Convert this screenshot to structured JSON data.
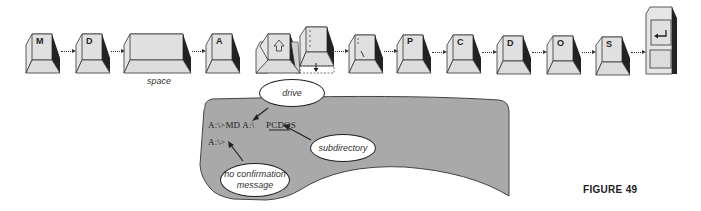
{
  "keys": [
    {
      "label": "M"
    },
    {
      "label": "D"
    },
    {
      "label": ""
    },
    {
      "label": "A"
    },
    {
      "label": "shift-arrow",
      "icon": "shift-up-arrow"
    },
    {
      "label": ":",
      "icon": "colon"
    },
    {
      "label": "\\",
      "icon": "backslash"
    },
    {
      "label": "P"
    },
    {
      "label": "C"
    },
    {
      "label": "D"
    },
    {
      "label": "O"
    },
    {
      "label": "S"
    },
    {
      "label": "enter",
      "icon": "enter-arrow"
    }
  ],
  "space_caption": "space",
  "screen": {
    "line1_prefix": "A:\\>MD A:\\",
    "line1_dir": "PCDOS",
    "line2": "A:\\>",
    "fill": "#a9a9a9"
  },
  "callouts": {
    "drive": "drive",
    "subdirectory": "subdirectory",
    "no_confirmation_line1": "no confirmation",
    "no_confirmation_line2": "message"
  },
  "figure_label": "FIGURE 49"
}
